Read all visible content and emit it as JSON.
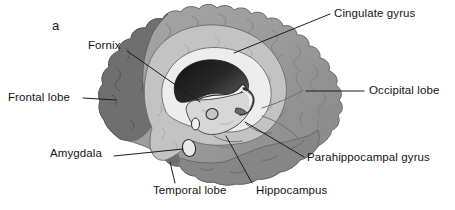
{
  "figure": {
    "type": "anatomical-diagram",
    "panel_letter": "a"
  },
  "labels": {
    "fornix": "Fornix",
    "cingulate": "Cingulate gyrus",
    "frontal": "Frontal lobe",
    "occipital": "Occipital lobe",
    "amygdala": "Amygdala",
    "temporal": "Temporal lobe",
    "hippocampus": "Hippocampus",
    "parahippocampal": "Parahippocampal gyrus"
  },
  "colors": {
    "background": "#ffffff",
    "cortex": "#9d9d9d",
    "frontal_lobe_dark": "#6f6f6f",
    "temporal_band": "#868686",
    "temporal_pole_dark": "#6f6f6f",
    "cingulate_light": "#c3c3c3",
    "white_matter_ring": "#ededed",
    "ventricle_dark": "#1a1a1a",
    "thalamus_light": "#d7d7d7",
    "outline": "#2c2c2c",
    "leader_line": "#1c1c1c",
    "text": "#141414"
  }
}
